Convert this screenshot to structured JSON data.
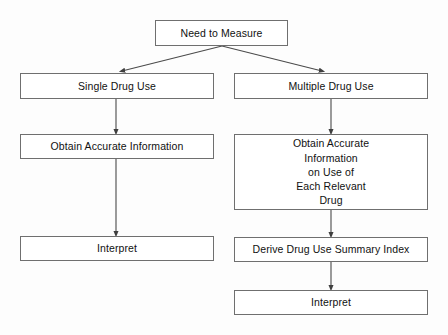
{
  "diagram": {
    "type": "flowchart",
    "style": {
      "box_fill": "#ffffff",
      "box_border": "#6f6f6f",
      "text_color": "#111111",
      "edge_color": "#4a4a4a",
      "page_background": "#fdfdfd"
    },
    "nodes": [
      {
        "id": "need-to-measure",
        "label": "Need to Measure",
        "x": 155,
        "y": 20,
        "width": 133,
        "height": 26,
        "multiline": false
      },
      {
        "id": "single-drug-use",
        "label": "Single Drug Use",
        "x": 20,
        "y": 73,
        "width": 194,
        "height": 26,
        "multiline": false
      },
      {
        "id": "multiple-drug-use",
        "label": "Multiple Drug Use",
        "x": 234,
        "y": 73,
        "width": 194,
        "height": 26,
        "multiline": false
      },
      {
        "id": "obtain-accurate-information",
        "label": "Obtain Accurate Information",
        "x": 20,
        "y": 134,
        "width": 194,
        "height": 25,
        "multiline": false
      },
      {
        "id": "obtain-accurate-information-each-drug",
        "label": "Obtain Accurate\nInformation\non Use of\nEach Relevant\nDrug",
        "x": 234,
        "y": 134,
        "width": 194,
        "height": 76,
        "multiline": true
      },
      {
        "id": "interpret-left",
        "label": "Interpret",
        "x": 20,
        "y": 236,
        "width": 194,
        "height": 25,
        "multiline": false
      },
      {
        "id": "derive-drug-use-summary-index",
        "label": "Derive Drug Use Summary Index",
        "x": 234,
        "y": 237,
        "width": 194,
        "height": 25,
        "multiline": false
      },
      {
        "id": "interpret-right",
        "label": "Interpret",
        "x": 234,
        "y": 290,
        "width": 194,
        "height": 25,
        "multiline": false
      }
    ],
    "edges": [
      {
        "id": "need-to-measure-to-single-drug-use",
        "from": "need-to-measure",
        "to": "single-drug-use",
        "kind": "diagonal",
        "x1": 222,
        "y1": 46,
        "x2": 122,
        "y2": 71
      },
      {
        "id": "need-to-measure-to-multiple-drug-use",
        "from": "need-to-measure",
        "to": "multiple-drug-use",
        "kind": "diagonal",
        "x1": 222,
        "y1": 46,
        "x2": 322,
        "y2": 71
      },
      {
        "id": "single-drug-use-to-obtain-accurate-information",
        "from": "single-drug-use",
        "to": "obtain-accurate-information",
        "kind": "vertical",
        "x1": 116,
        "y1": 99,
        "x2": 116,
        "y2": 132
      },
      {
        "id": "multiple-drug-use-to-obtain-accurate-information-each-drug",
        "from": "multiple-drug-use",
        "to": "obtain-accurate-information-each-drug",
        "kind": "vertical",
        "x1": 331,
        "y1": 99,
        "x2": 331,
        "y2": 132
      },
      {
        "id": "obtain-accurate-information-to-interpret-left",
        "from": "obtain-accurate-information",
        "to": "interpret-left",
        "kind": "vertical",
        "x1": 116,
        "y1": 159,
        "x2": 116,
        "y2": 234
      },
      {
        "id": "obtain-accurate-information-each-drug-to-derive-index",
        "from": "obtain-accurate-information-each-drug",
        "to": "derive-drug-use-summary-index",
        "kind": "vertical",
        "x1": 331,
        "y1": 210,
        "x2": 331,
        "y2": 235
      },
      {
        "id": "derive-index-to-interpret-right",
        "from": "derive-drug-use-summary-index",
        "to": "interpret-right",
        "kind": "vertical",
        "x1": 331,
        "y1": 262,
        "x2": 331,
        "y2": 288
      }
    ]
  }
}
